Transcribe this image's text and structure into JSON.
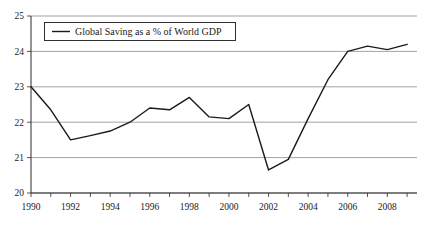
{
  "chart_data": {
    "type": "line",
    "title": "",
    "xlabel": "",
    "ylabel": "",
    "xlim": [
      1990,
      2009.5
    ],
    "ylim": [
      20,
      25
    ],
    "grid": true,
    "legend_position": "top-left-inside",
    "x": [
      1990,
      1991,
      1992,
      1993,
      1994,
      1995,
      1996,
      1997,
      1998,
      1999,
      2000,
      2001,
      2002,
      2003,
      2004,
      2005,
      2006,
      2007,
      2008,
      2009
    ],
    "series": [
      {
        "name": "Global Saving as a % of World GDP",
        "values": [
          23.0,
          22.35,
          21.5,
          21.62,
          21.75,
          22.0,
          22.4,
          22.35,
          22.7,
          22.15,
          22.1,
          22.5,
          20.65,
          20.95,
          22.1,
          23.2,
          24.0,
          24.15,
          24.05,
          24.2
        ]
      }
    ],
    "xticks": [
      1990,
      1992,
      1994,
      1996,
      1998,
      2000,
      2002,
      2004,
      2006,
      2008
    ],
    "xtick_labels": [
      "1990",
      "1992",
      "1994",
      "1996",
      "1998",
      "2000",
      "2002",
      "2004",
      "2006",
      "2008"
    ],
    "yticks": [
      20,
      21,
      22,
      23,
      24,
      25
    ],
    "ytick_labels": [
      "20",
      "21",
      "22",
      "23",
      "24",
      "25"
    ],
    "colors": {
      "line": "#1a1a1a",
      "grid": "#8c8c8c",
      "axis": "#2a2a2a",
      "text": "#1a1a1a",
      "background": "#ffffff"
    }
  },
  "legend": {
    "entries": [
      {
        "label": "Global Saving as a % of World GDP"
      }
    ]
  }
}
